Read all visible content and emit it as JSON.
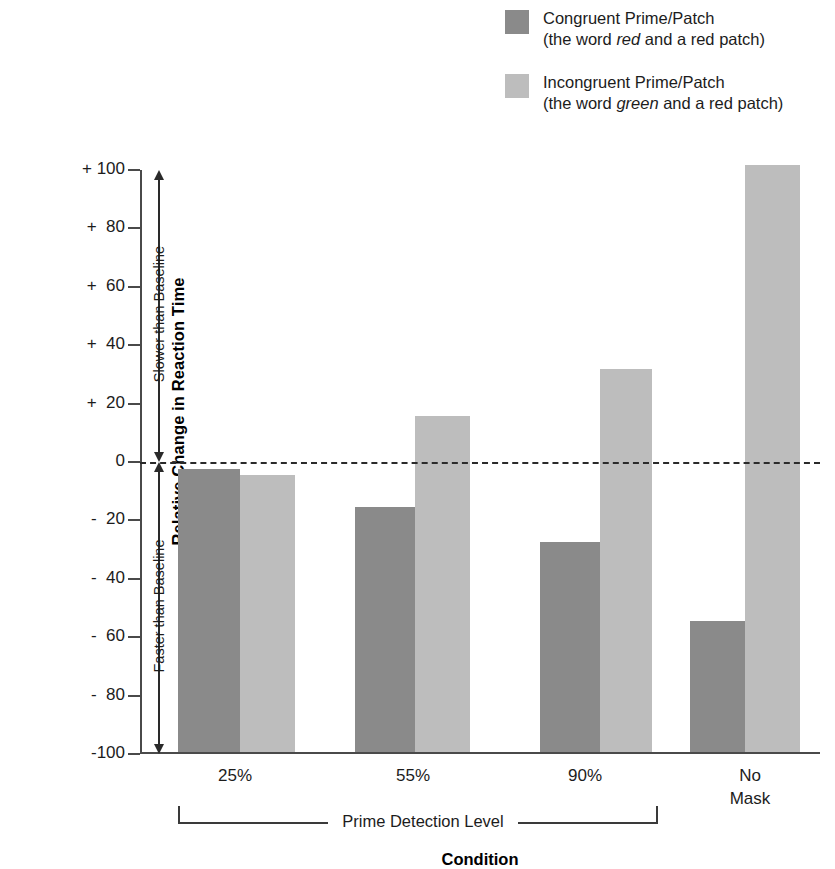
{
  "legend": {
    "items": [
      {
        "name": "congruent",
        "color": "#8a8a8a",
        "line1": "Congruent Prime/Patch",
        "line2_pre": "(the word ",
        "line2_em": "red",
        "line2_post": " and a red patch)"
      },
      {
        "name": "incongruent",
        "color": "#bdbdbd",
        "line1": "Incongruent Prime/Patch",
        "line2_pre": "(the word ",
        "line2_em": "green",
        "line2_post": " and a red patch)"
      }
    ]
  },
  "axes": {
    "y_title": "Relative Change in Reaction Time",
    "x_title": "Condition",
    "y_ticks": [
      "+ 100",
      "+  80",
      "+  60",
      "+  40",
      "+  20",
      "0",
      "-  20",
      "-  40",
      "-  60",
      "-  80",
      "-100"
    ],
    "x_categories": [
      "25%",
      "55%",
      "90%",
      "No Mask"
    ],
    "bracket_label": "Prime Detection Level",
    "annotation_upper": "Slower than Baseline",
    "annotation_lower": "Faster than Baseline"
  },
  "chart_data": {
    "type": "bar",
    "title": "",
    "xlabel": "Condition",
    "ylabel": "Relative Change in Reaction Time",
    "ylim": [
      -100,
      100
    ],
    "ytick_values": [
      100,
      80,
      60,
      40,
      20,
      0,
      -20,
      -40,
      -60,
      -80,
      -100
    ],
    "grid": false,
    "legend_position": "top-right",
    "baseline": 0,
    "bars_drawn_from": -100,
    "categories": [
      "25%",
      "55%",
      "90%",
      "No Mask"
    ],
    "series": [
      {
        "name": "Congruent Prime/Patch",
        "color": "#8a8a8a",
        "values": [
          -3,
          -16,
          -28,
          -55
        ]
      },
      {
        "name": "Incongruent Prime/Patch",
        "color": "#bdbdbd",
        "values": [
          -5,
          15,
          31,
          101
        ]
      }
    ],
    "annotations": [
      {
        "text": "Slower than Baseline",
        "range": [
          0,
          100
        ],
        "orientation": "vertical"
      },
      {
        "text": "Faster than Baseline",
        "range": [
          -100,
          0
        ],
        "orientation": "vertical"
      },
      {
        "text": "Prime Detection Level",
        "spans_categories": [
          "25%",
          "55%",
          "90%"
        ]
      }
    ]
  },
  "geometry": {
    "bars": [
      {
        "group": 0,
        "series": 0,
        "left": 38,
        "width": 62
      },
      {
        "group": 0,
        "series": 1,
        "left": 100,
        "width": 55
      },
      {
        "group": 1,
        "series": 0,
        "left": 215,
        "width": 60
      },
      {
        "group": 1,
        "series": 1,
        "left": 275,
        "width": 55
      },
      {
        "group": 2,
        "series": 0,
        "left": 400,
        "width": 60
      },
      {
        "group": 2,
        "series": 1,
        "left": 460,
        "width": 52
      },
      {
        "group": 3,
        "series": 0,
        "left": 550,
        "width": 55
      },
      {
        "group": 3,
        "series": 1,
        "left": 605,
        "width": 55
      }
    ],
    "xlabel_positions": [
      {
        "left": 30,
        "width": 130
      },
      {
        "left": 208,
        "width": 130
      },
      {
        "left": 380,
        "width": 130
      },
      {
        "left": 545,
        "width": 130
      }
    ]
  }
}
